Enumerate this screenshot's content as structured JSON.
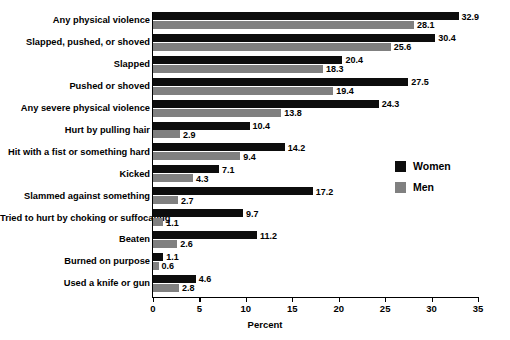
{
  "chart_data": {
    "type": "bar",
    "orientation": "horizontal",
    "title": "",
    "xlabel": "Percent",
    "ylabel": "",
    "xlim": [
      0,
      35
    ],
    "xticks": [
      0,
      5,
      10,
      15,
      20,
      25,
      30,
      35
    ],
    "grid": false,
    "legend_position": "right",
    "categories": [
      "Any physical violence",
      "Slapped, pushed, or shoved",
      "Slapped",
      "Pushed or shoved",
      "Any severe physical violence",
      "Hurt by pulling hair",
      "Hit with a fist or something hard",
      "Kicked",
      "Slammed against something",
      "Tried to hurt by choking or suffocating",
      "Beaten",
      "Burned on purpose",
      "Used a knife or gun"
    ],
    "series": [
      {
        "name": "Women",
        "color": "#0d0d0d",
        "values": [
          32.9,
          30.4,
          20.4,
          27.5,
          24.3,
          10.4,
          14.2,
          7.1,
          17.2,
          9.7,
          11.2,
          1.1,
          4.6
        ]
      },
      {
        "name": "Men",
        "color": "#808080",
        "values": [
          28.1,
          25.6,
          18.3,
          19.4,
          13.8,
          2.9,
          9.4,
          4.3,
          2.7,
          1.1,
          2.6,
          0.6,
          2.8
        ]
      }
    ]
  }
}
